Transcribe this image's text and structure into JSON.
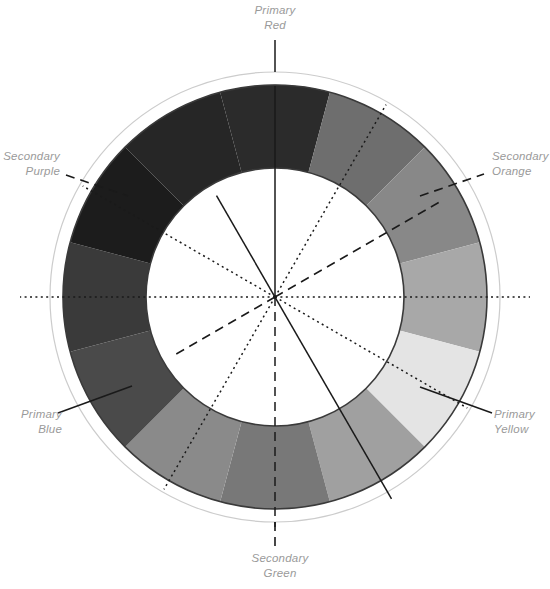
{
  "diagram": {
    "type": "grayscale-color-wheel",
    "center": {
      "x": 275,
      "y": 297
    },
    "radii": {
      "outline_circle": 225,
      "ring_outer": 212,
      "ring_inner": 129
    },
    "segment_count": 12,
    "segment_arc_degrees": 30,
    "colors": {
      "label_text": "#9a9a9a",
      "outline_circle_stroke": "#cccccc",
      "ring_stroke": "#3a3a3a",
      "leader_line": "#1a1a1a",
      "background": "#ffffff"
    }
  },
  "labels": [
    {
      "id": "primary-red",
      "line1": "Primary",
      "line2": "Red",
      "kind": "primary",
      "angle_deg": 0,
      "leader_style": "solid",
      "text_x": 275,
      "text_y": 14,
      "anchor": "middle"
    },
    {
      "id": "secondary-orange",
      "line1": "Secondary",
      "line2": "Orange",
      "kind": "secondary",
      "angle_deg": 60,
      "leader_style": "dashed",
      "text_x": 492,
      "text_y": 160,
      "anchor": "start"
    },
    {
      "id": "primary-yellow",
      "line1": "Primary",
      "line2": "Yellow",
      "kind": "primary",
      "angle_deg": 120,
      "leader_style": "solid",
      "text_x": 494,
      "text_y": 418,
      "anchor": "start"
    },
    {
      "id": "secondary-green",
      "line1": "Secondary",
      "line2": "Green",
      "kind": "secondary",
      "angle_deg": 180,
      "leader_style": "dashed",
      "text_x": 280,
      "text_y": 562,
      "anchor": "middle"
    },
    {
      "id": "primary-blue",
      "line1": "Primary",
      "line2": "Blue",
      "kind": "primary",
      "angle_deg": 240,
      "leader_style": "solid",
      "text_x": 62,
      "text_y": 418,
      "anchor": "end"
    },
    {
      "id": "secondary-purple",
      "line1": "Secondary",
      "line2": "Purple",
      "kind": "secondary",
      "angle_deg": 300,
      "leader_style": "dashed",
      "text_x": 60,
      "text_y": 160,
      "anchor": "end"
    }
  ],
  "axes": [
    {
      "id": "axis-red-green",
      "style": "solid-top-dashed-bottom",
      "top_style": "solid",
      "bottom_style": "dashed",
      "angle_deg": 0,
      "from": "Primary Red",
      "to": "Secondary Green"
    },
    {
      "id": "axis-tertiary-1",
      "style": "dotted",
      "angle_deg": 30,
      "from": "Tertiary",
      "to": "Tertiary"
    },
    {
      "id": "axis-purple-orange",
      "style": "dashed",
      "angle_deg": 60,
      "from": "Secondary Purple",
      "to": "Secondary Orange"
    },
    {
      "id": "axis-horizontal",
      "style": "dotted",
      "angle_deg": 90,
      "from": "Tertiary",
      "to": "Tertiary"
    },
    {
      "id": "axis-tertiary-2",
      "style": "dotted",
      "angle_deg": 120,
      "from": "Tertiary",
      "to": "Tertiary"
    },
    {
      "id": "axis-blue-yellow",
      "style": "solid",
      "angle_deg": 150,
      "from": "Primary Blue",
      "to": "Primary Yellow"
    }
  ],
  "chart_data": {
    "type": "pie",
    "xlabel": "",
    "ylabel": "",
    "legend_position": "around",
    "categories": [
      "Primary Red",
      "Red-Orange",
      "Secondary Orange",
      "Yellow-Orange",
      "Primary Yellow",
      "Yellow-Green",
      "Secondary Green",
      "Blue-Green",
      "Primary Blue",
      "Blue-Purple",
      "Secondary Purple",
      "Red-Purple"
    ],
    "values": [
      30,
      30,
      30,
      30,
      30,
      30,
      30,
      30,
      30,
      30,
      30,
      30
    ],
    "segments": [
      {
        "index": 0,
        "name": "Primary Red",
        "start_deg": -15,
        "end_deg": 15,
        "gray": "#2b2b2b",
        "is_primary": true,
        "is_secondary": false
      },
      {
        "index": 1,
        "name": "Red-Orange",
        "start_deg": 15,
        "end_deg": 45,
        "gray": "#6e6e6e",
        "is_primary": false,
        "is_secondary": false
      },
      {
        "index": 2,
        "name": "Secondary Orange",
        "start_deg": 45,
        "end_deg": 75,
        "gray": "#888888",
        "is_primary": false,
        "is_secondary": true
      },
      {
        "index": 3,
        "name": "Yellow-Orange",
        "start_deg": 75,
        "end_deg": 105,
        "gray": "#a8a8a8",
        "is_primary": false,
        "is_secondary": false
      },
      {
        "index": 4,
        "name": "Primary Yellow",
        "start_deg": 105,
        "end_deg": 135,
        "gray": "#e4e4e4",
        "is_primary": true,
        "is_secondary": false
      },
      {
        "index": 5,
        "name": "Yellow-Green",
        "start_deg": 135,
        "end_deg": 165,
        "gray": "#a0a0a0",
        "is_primary": false,
        "is_secondary": false
      },
      {
        "index": 6,
        "name": "Secondary Green",
        "start_deg": 165,
        "end_deg": 195,
        "gray": "#787878",
        "is_primary": false,
        "is_secondary": true
      },
      {
        "index": 7,
        "name": "Blue-Green",
        "start_deg": 195,
        "end_deg": 225,
        "gray": "#8a8a8a",
        "is_primary": false,
        "is_secondary": false
      },
      {
        "index": 8,
        "name": "Primary Blue",
        "start_deg": 225,
        "end_deg": 255,
        "gray": "#4a4a4a",
        "is_primary": true,
        "is_secondary": false
      },
      {
        "index": 9,
        "name": "Blue-Purple",
        "start_deg": 255,
        "end_deg": 285,
        "gray": "#3a3a3a",
        "is_primary": false,
        "is_secondary": false
      },
      {
        "index": 10,
        "name": "Secondary Purple",
        "start_deg": 285,
        "end_deg": 315,
        "gray": "#1c1c1c",
        "is_primary": false,
        "is_secondary": true
      },
      {
        "index": 11,
        "name": "Red-Purple",
        "start_deg": 315,
        "end_deg": 345,
        "gray": "#262626",
        "is_primary": false,
        "is_secondary": false
      }
    ]
  }
}
